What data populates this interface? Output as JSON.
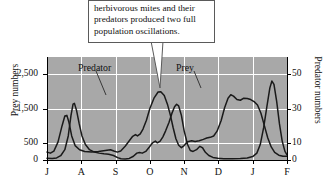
{
  "callout": {
    "lines": [
      "herbivorous mites and their",
      "predators produced two full",
      "population oscillations."
    ]
  },
  "chart_data": {
    "type": "line",
    "title": "",
    "xlabel": "",
    "ylabel": "Prey numbers",
    "y2label": "Predator numbers",
    "grid": true,
    "legend_position": "inline-annotations",
    "plot_background": "#a8a8a8",
    "line_color": "#1a1a1a",
    "x_categories": [
      "J",
      "A",
      "S",
      "O",
      "N",
      "D",
      "J",
      "F"
    ],
    "xlim": [
      0,
      7
    ],
    "ylim": [
      0,
      3000
    ],
    "y2lim": [
      0,
      60
    ],
    "y_ticks": [
      "0",
      "500",
      "1,500",
      "2,500"
    ],
    "y_tick_values": [
      0,
      500,
      1500,
      2500
    ],
    "y2_ticks": [
      "0",
      "10",
      "30",
      "50"
    ],
    "y2_tick_values": [
      0,
      10,
      30,
      50
    ],
    "series": [
      {
        "name": "Prey",
        "axis": "left",
        "annotation": "Prey",
        "points": [
          [
            0.0,
            230
          ],
          [
            0.1,
            200
          ],
          [
            0.2,
            260
          ],
          [
            0.32,
            520
          ],
          [
            0.44,
            1000
          ],
          [
            0.52,
            1280
          ],
          [
            0.58,
            1300
          ],
          [
            0.64,
            1100
          ],
          [
            0.72,
            700
          ],
          [
            0.82,
            420
          ],
          [
            0.95,
            300
          ],
          [
            1.1,
            250
          ],
          [
            1.3,
            230
          ],
          [
            1.5,
            250
          ],
          [
            1.7,
            280
          ],
          [
            1.85,
            300
          ],
          [
            1.95,
            260
          ],
          [
            2.05,
            230
          ],
          [
            2.15,
            260
          ],
          [
            2.28,
            400
          ],
          [
            2.4,
            560
          ],
          [
            2.5,
            690
          ],
          [
            2.58,
            740
          ],
          [
            2.64,
            700
          ],
          [
            2.72,
            760
          ],
          [
            2.8,
            900
          ],
          [
            2.9,
            1160
          ],
          [
            3.0,
            1500
          ],
          [
            3.12,
            1800
          ],
          [
            3.24,
            1980
          ],
          [
            3.32,
            1990
          ],
          [
            3.42,
            1880
          ],
          [
            3.52,
            1600
          ],
          [
            3.6,
            1300
          ],
          [
            3.68,
            940
          ],
          [
            3.76,
            620
          ],
          [
            3.84,
            430
          ],
          [
            3.92,
            360
          ],
          [
            4.0,
            420
          ],
          [
            4.1,
            530
          ],
          [
            4.22,
            560
          ],
          [
            4.32,
            540
          ],
          [
            4.44,
            560
          ],
          [
            4.56,
            600
          ],
          [
            4.66,
            640
          ],
          [
            4.76,
            660
          ],
          [
            4.86,
            700
          ],
          [
            4.96,
            840
          ],
          [
            5.08,
            1150
          ],
          [
            5.18,
            1520
          ],
          [
            5.28,
            1800
          ],
          [
            5.36,
            1900
          ],
          [
            5.44,
            1860
          ],
          [
            5.54,
            1760
          ],
          [
            5.64,
            1740
          ],
          [
            5.74,
            1800
          ],
          [
            5.84,
            1790
          ],
          [
            5.94,
            1760
          ],
          [
            6.04,
            1700
          ],
          [
            6.14,
            1600
          ],
          [
            6.24,
            1360
          ],
          [
            6.34,
            1000
          ],
          [
            6.44,
            640
          ],
          [
            6.54,
            380
          ],
          [
            6.64,
            220
          ],
          [
            6.76,
            140
          ],
          [
            6.88,
            110
          ],
          [
            7.0,
            110
          ]
        ]
      },
      {
        "name": "Predator",
        "axis": "right",
        "annotation": "Predator",
        "points": [
          [
            0.0,
            1.0
          ],
          [
            0.15,
            0.9
          ],
          [
            0.28,
            1.2
          ],
          [
            0.4,
            2.5
          ],
          [
            0.52,
            6.0
          ],
          [
            0.62,
            14.0
          ],
          [
            0.7,
            26.0
          ],
          [
            0.76,
            32.5
          ],
          [
            0.8,
            33.0
          ],
          [
            0.86,
            29.0
          ],
          [
            0.94,
            21.0
          ],
          [
            1.02,
            14.0
          ],
          [
            1.12,
            9.0
          ],
          [
            1.24,
            6.0
          ],
          [
            1.38,
            4.6
          ],
          [
            1.52,
            4.0
          ],
          [
            1.66,
            3.6
          ],
          [
            1.8,
            3.4
          ],
          [
            1.94,
            2.6
          ],
          [
            2.06,
            1.4
          ],
          [
            2.16,
            0.7
          ],
          [
            2.28,
            0.6
          ],
          [
            2.4,
            0.9
          ],
          [
            2.52,
            2.2
          ],
          [
            2.62,
            4.0
          ],
          [
            2.7,
            4.4
          ],
          [
            2.78,
            4.0
          ],
          [
            2.88,
            5.0
          ],
          [
            2.98,
            7.4
          ],
          [
            3.08,
            10.0
          ],
          [
            3.16,
            11.0
          ],
          [
            3.22,
            10.0
          ],
          [
            3.3,
            11.0
          ],
          [
            3.38,
            13.5
          ],
          [
            3.46,
            17.0
          ],
          [
            3.56,
            22.0
          ],
          [
            3.64,
            27.0
          ],
          [
            3.72,
            31.0
          ],
          [
            3.78,
            32.5
          ],
          [
            3.84,
            31.5
          ],
          [
            3.92,
            26.0
          ],
          [
            4.0,
            17.0
          ],
          [
            4.1,
            9.0
          ],
          [
            4.18,
            5.5
          ],
          [
            4.26,
            5.0
          ],
          [
            4.36,
            6.0
          ],
          [
            4.46,
            8.0
          ],
          [
            4.54,
            7.0
          ],
          [
            4.62,
            4.5
          ],
          [
            4.72,
            2.6
          ],
          [
            4.84,
            1.5
          ],
          [
            4.98,
            1.0
          ],
          [
            5.16,
            0.8
          ],
          [
            5.4,
            0.8
          ],
          [
            5.64,
            0.9
          ],
          [
            5.84,
            1.2
          ],
          [
            6.0,
            2.0
          ],
          [
            6.12,
            4.0
          ],
          [
            6.22,
            9.0
          ],
          [
            6.32,
            19.0
          ],
          [
            6.42,
            32.0
          ],
          [
            6.5,
            42.0
          ],
          [
            6.56,
            46.0
          ],
          [
            6.62,
            44.0
          ],
          [
            6.7,
            34.0
          ],
          [
            6.78,
            21.0
          ],
          [
            6.86,
            11.0
          ],
          [
            6.94,
            5.0
          ],
          [
            7.0,
            3.0
          ]
        ]
      }
    ],
    "annotations": [
      {
        "text": "Predator",
        "x_px": 78,
        "y_px": 62,
        "leader_to": [
          106,
          95
        ]
      },
      {
        "text": "Prey",
        "x_px": 176,
        "y_px": 62,
        "leader_to": [
          201,
          88
        ]
      }
    ]
  }
}
